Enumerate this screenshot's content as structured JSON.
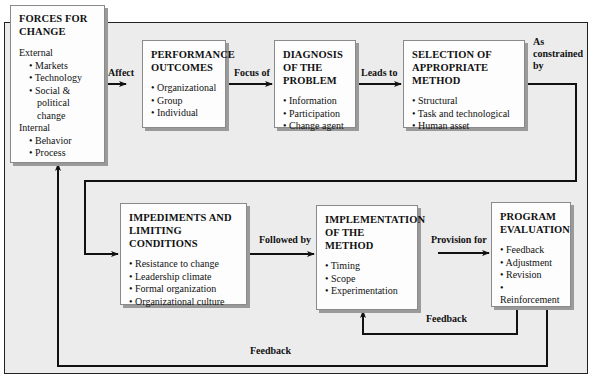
{
  "diagram": {
    "boxes": {
      "forces": {
        "title": "FORCES FOR CHANGE",
        "external_label": "External",
        "external_items": [
          "Markets",
          "Technology",
          "Social & political change"
        ],
        "internal_label": "Internal",
        "internal_items": [
          "Behavior",
          "Process"
        ]
      },
      "performance": {
        "title": "PERFORMANCE OUTCOMES",
        "items": [
          "Organizational",
          "Group",
          "Individual"
        ]
      },
      "diagnosis": {
        "title": "DIAGNOSIS OF THE PROBLEM",
        "items": [
          "Information",
          "Participation",
          "Change agent"
        ]
      },
      "selection": {
        "title": "SELECTION OF APPROPRIATE METHOD",
        "items": [
          "Structural",
          "Task and technological",
          "Human asset"
        ]
      },
      "impediments": {
        "title": "IMPEDIMENTS AND LIMITING CONDITIONS",
        "items": [
          "Resistance to change",
          "Leadership climate",
          "Formal organization",
          "Organizational culture"
        ]
      },
      "implementation": {
        "title": "IMPLEMENTATION OF THE METHOD",
        "items": [
          "Timing",
          "Scope",
          "Experimentation"
        ]
      },
      "evaluation": {
        "title": "PROGRAM EVALUATION",
        "items": [
          "Feedback",
          "Adjustment",
          "Revision",
          "Reinforcement"
        ]
      }
    },
    "edges": {
      "affect": "Affect",
      "focus_of": "Focus of",
      "leads_to": "Leads to",
      "as_constrained_by_1": "As",
      "as_constrained_by_2": "constrained",
      "as_constrained_by_3": "by",
      "followed_by": "Followed by",
      "provision_for": "Provision for",
      "feedback_inner": "Feedback",
      "feedback_outer": "Feedback"
    },
    "colors": {
      "background": "#ececec",
      "box_fill": "#fdfdfd",
      "box_shadow": "#9a9a9a",
      "line": "#111111"
    }
  }
}
